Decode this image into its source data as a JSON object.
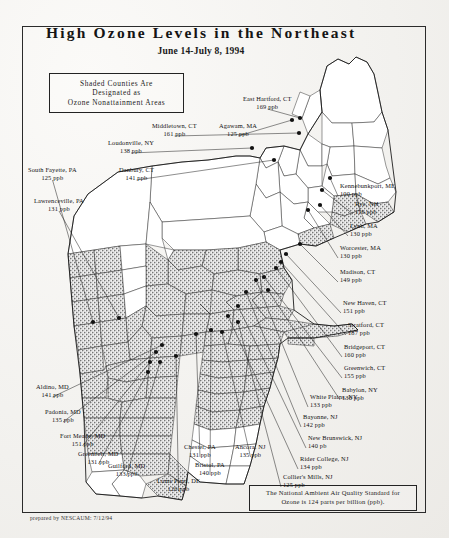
{
  "map": {
    "title": "High Ozone Levels in the Northeast",
    "subtitle": "June 14-July 8, 1994",
    "legend": {
      "line1": "Shaded Counties Are",
      "line2": "Designated as",
      "line3": "Ozone Nonattainment Areas"
    },
    "standard_note": {
      "line1": "The National Ambient Air Quality Standard for",
      "line2": "Ozone is 124 parts per billion (ppb)."
    },
    "credit": "prepared by NESCAUM: 7/12/94"
  },
  "monitors": [
    {
      "id": "east-hartford-ct",
      "site": "East Hartford, CT",
      "value": "169 ppb",
      "ppb": 169,
      "align": "ctr",
      "x": 243,
      "y": 95,
      "lx": 300,
      "ly": 118
    },
    {
      "id": "middletown-ct",
      "site": "Middletown, CT",
      "value": "161 ppb",
      "ppb": 161,
      "align": "ctr",
      "x": 152,
      "y": 122,
      "lx": 299,
      "ly": 133
    },
    {
      "id": "agawam-ma",
      "site": "Agawam, MA",
      "value": "125 ppb",
      "ppb": 125,
      "align": "ctr",
      "x": 219,
      "y": 122,
      "lx": 292,
      "ly": 120
    },
    {
      "id": "loudonville-ny",
      "site": "Loudonville, NY",
      "value": "138 ppb",
      "ppb": 138,
      "align": "ctr",
      "x": 108,
      "y": 139,
      "lx": 252,
      "ly": 148
    },
    {
      "id": "danbury-ct",
      "site": "Danbury, CT",
      "value": "141 ppb",
      "ppb": 141,
      "align": "ctr",
      "x": 119,
      "y": 166,
      "lx": 274,
      "ly": 160
    },
    {
      "id": "south-fayette-pa",
      "site": "South Fayette, PA",
      "value": "125 ppb",
      "ppb": 125,
      "align": "ctr",
      "x": 28,
      "y": 166,
      "lx": 93,
      "ly": 322
    },
    {
      "id": "lawrenceville-pa",
      "site": "Lawrenceville, PA",
      "value": "131 ppb",
      "ppb": 131,
      "align": "ctr",
      "x": 34,
      "y": 197,
      "lx": 119,
      "ly": 318
    },
    {
      "id": "kennebunkport-me",
      "site": "Kennebunkport, ME",
      "value": "100 ppb",
      "ppb": 100,
      "align": "lft",
      "x": 340,
      "y": 182,
      "lx": 330,
      "ly": 178
    },
    {
      "id": "rye-nh",
      "site": "Rye, NH",
      "value": "116 ppb",
      "ppb": 116,
      "align": "lft",
      "x": 355,
      "y": 200,
      "lx": 322,
      "ly": 190
    },
    {
      "id": "lynn-ma",
      "site": "Lynn, MA",
      "value": "130 ppb",
      "ppb": 130,
      "align": "lft",
      "x": 350,
      "y": 222,
      "lx": 320,
      "ly": 205
    },
    {
      "id": "worcester-ma",
      "site": "Worcester, MA",
      "value": "130 ppb",
      "ppb": 130,
      "align": "lft",
      "x": 340,
      "y": 244,
      "lx": 308,
      "ly": 210
    },
    {
      "id": "madison-ct",
      "site": "Madison, CT",
      "value": "149 ppb",
      "ppb": 149,
      "align": "lft",
      "x": 340,
      "y": 268,
      "lx": 300,
      "ly": 244
    },
    {
      "id": "new-haven-ct",
      "site": "New Haven, CT",
      "value": "151 ppb",
      "ppb": 151,
      "align": "lft",
      "x": 343,
      "y": 299,
      "lx": 286,
      "ly": 254
    },
    {
      "id": "stratford-ct",
      "site": "Stratford, CT",
      "value": "187 ppb",
      "ppb": 187,
      "align": "lft",
      "x": 348,
      "y": 321,
      "lx": 281,
      "ly": 262
    },
    {
      "id": "bridgeport-ct",
      "site": "Bridgeport, CT",
      "value": "160 ppb",
      "ppb": 160,
      "align": "lft",
      "x": 344,
      "y": 343,
      "lx": 276,
      "ly": 268
    },
    {
      "id": "greenwich-ct",
      "site": "Greenwich, CT",
      "value": "155 ppb",
      "ppb": 155,
      "align": "lft",
      "x": 344,
      "y": 364,
      "lx": 264,
      "ly": 277
    },
    {
      "id": "babylon-ny",
      "site": "Babylon, NY",
      "value": "136 ppb",
      "ppb": 136,
      "align": "lft",
      "x": 342,
      "y": 386,
      "lx": 268,
      "ly": 290
    },
    {
      "id": "white-plains-ny",
      "site": "White Plains, NY",
      "value": "133 ppb",
      "ppb": 133,
      "align": "lft",
      "x": 310,
      "y": 393,
      "lx": 256,
      "ly": 280
    },
    {
      "id": "bayonne-nj",
      "site": "Bayonne, NJ",
      "value": "142 ppb",
      "ppb": 142,
      "align": "lft",
      "x": 303,
      "y": 413,
      "lx": 246,
      "ly": 292
    },
    {
      "id": "new-brunswick-nj",
      "site": "New Brunswick, NJ",
      "value": "140 pb",
      "ppb": 140,
      "align": "lft",
      "x": 308,
      "y": 434,
      "lx": 238,
      "ly": 306
    },
    {
      "id": "rider-college-nj",
      "site": "Rider College, NJ",
      "value": "134 ppb",
      "ppb": 134,
      "align": "lft",
      "x": 300,
      "y": 455,
      "lx": 228,
      "ly": 316
    },
    {
      "id": "colliers-mills-nj",
      "site": "Collier's Mills, NJ",
      "value": "125 ppb",
      "ppb": 125,
      "align": "lft",
      "x": 283,
      "y": 473,
      "lx": 238,
      "ly": 322
    },
    {
      "id": "ancora-nj",
      "site": "Ancora, NJ",
      "value": "135 ppb",
      "ppb": 135,
      "align": "ctr",
      "x": 235,
      "y": 443,
      "lx": 222,
      "ly": 332
    },
    {
      "id": "bristol-pa",
      "site": "Bristol, PA",
      "value": "140 ppb",
      "ppb": 140,
      "align": "ctr",
      "x": 195,
      "y": 461,
      "lx": 211,
      "ly": 330
    },
    {
      "id": "chester-pa",
      "site": "Chester, PA",
      "value": "131 ppb",
      "ppb": 131,
      "align": "ctr",
      "x": 184,
      "y": 443,
      "lx": 196,
      "ly": 334
    },
    {
      "id": "lums-pond-de",
      "site": "Lums Pond, DE",
      "value": "126 ppb",
      "ppb": 126,
      "align": "ctr",
      "x": 157,
      "y": 477,
      "lx": 176,
      "ly": 356
    },
    {
      "id": "guilford-md",
      "site": "Guilford, MD",
      "value": "133 ppb",
      "ppb": 133,
      "align": "ctr",
      "x": 108,
      "y": 462,
      "lx": 160,
      "ly": 362
    },
    {
      "id": "greenbelt-md",
      "site": "Greenbelt, MD",
      "value": "131 ppb",
      "ppb": 131,
      "align": "ctr",
      "x": 78,
      "y": 450,
      "lx": 148,
      "ly": 372
    },
    {
      "id": "fort-meade-md",
      "site": "Fort Meade, MD",
      "value": "151 ppb",
      "ppb": 151,
      "align": "ctr",
      "x": 60,
      "y": 432,
      "lx": 150,
      "ly": 362
    },
    {
      "id": "padonia-md",
      "site": "Padonia, MD",
      "value": "135 ppb",
      "ppb": 135,
      "align": "ctr",
      "x": 45,
      "y": 408,
      "lx": 156,
      "ly": 352
    },
    {
      "id": "aldino-md",
      "site": "Aldino, MD",
      "value": "141 ppb",
      "ppb": 141,
      "align": "ctr",
      "x": 36,
      "y": 383,
      "lx": 162,
      "ly": 345
    }
  ]
}
